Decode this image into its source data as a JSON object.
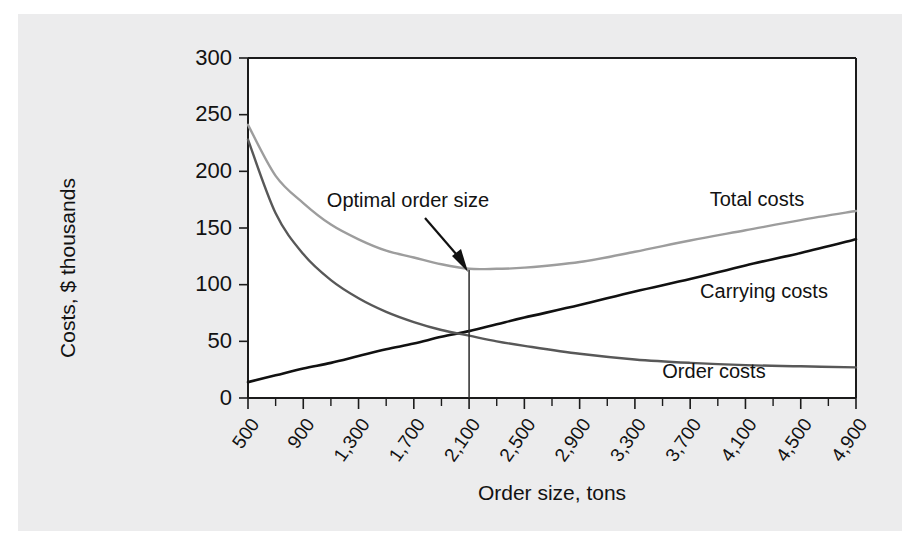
{
  "figure": {
    "background_color": "#ffffff",
    "panel_color": "#ececed",
    "plot_background": "#ffffff"
  },
  "chart_data": {
    "type": "line",
    "title": "",
    "subtitle": "",
    "xlabel": "Order size, tons",
    "ylabel": "Costs, $ thousands",
    "xlim": [
      500,
      4900
    ],
    "ylim": [
      0,
      300
    ],
    "grid": false,
    "legend_position": "inline-right",
    "x_tick_labels": [
      "500",
      "900",
      "1,300",
      "1,700",
      "2,100",
      "2,500",
      "2,900",
      "3,300",
      "3,700",
      "4,100",
      "4,500",
      "4,900"
    ],
    "x_tick_values": [
      500,
      900,
      1300,
      1700,
      2100,
      2500,
      2900,
      3300,
      3700,
      4100,
      4500,
      4900
    ],
    "x_minor_tick_step": 200,
    "y_tick_labels": [
      "0",
      "50",
      "100",
      "150",
      "200",
      "250",
      "300"
    ],
    "y_tick_values": [
      0,
      50,
      100,
      150,
      200,
      250,
      300
    ],
    "x": [
      500,
      700,
      900,
      1100,
      1300,
      1500,
      1700,
      1900,
      2100,
      2300,
      2500,
      2900,
      3300,
      3700,
      4100,
      4500,
      4900
    ],
    "series": [
      {
        "name": "Total costs",
        "label": "Total costs",
        "color": "#9d9d9d",
        "width": 2.4,
        "values": [
          241,
          196,
          172,
          153,
          140,
          130,
          124,
          118,
          114,
          114,
          115,
          120,
          129,
          139,
          148,
          157,
          165
        ]
      },
      {
        "name": "Carrying costs",
        "label": "Carrying costs",
        "color": "#111111",
        "width": 2.6,
        "values": [
          14,
          20,
          26,
          31,
          37,
          43,
          48,
          54,
          59,
          65,
          71,
          82,
          94,
          105,
          117,
          128,
          140
        ]
      },
      {
        "name": "Order costs",
        "label": "Order costs",
        "color": "#585858",
        "width": 2.4,
        "values": [
          228,
          163,
          127,
          104,
          88,
          76,
          67,
          60,
          55,
          50,
          46,
          39,
          34,
          31,
          29,
          28,
          27
        ]
      }
    ],
    "annotations": [
      {
        "name": "optimal-order-size",
        "text": "Optimal order size",
        "x": 2100,
        "y": 113,
        "marker": "vertical-line-with-arrow"
      }
    ]
  },
  "labels": {
    "total_costs": "Total costs",
    "carrying_costs": "Carrying costs",
    "order_costs": "Order costs",
    "optimal_order_size": "Optimal order size",
    "x_axis_title": "Order size, tons",
    "y_axis_title": "Costs, $ thousands"
  }
}
